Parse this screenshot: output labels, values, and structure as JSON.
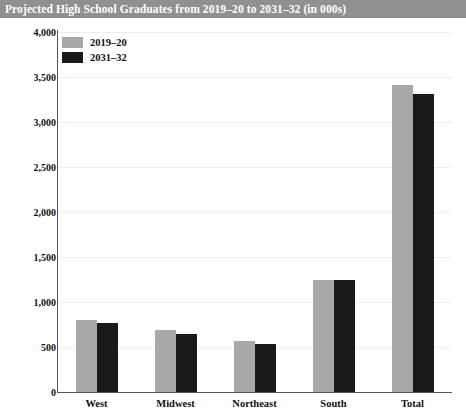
{
  "title": "Projected High School Graduates from 2019–20 to 2031–32 (in 000s)",
  "colors": {
    "title_bar_bg": "#909090",
    "title_text": "#ffffff",
    "series_a": "#a8a8a8",
    "series_b": "#1a1a1a",
    "gridline": "#eeeeee",
    "axis": "#555555",
    "background": "#ffffff"
  },
  "legend": {
    "position": "top-left",
    "entries": [
      {
        "label": "2019–20",
        "color": "#a8a8a8"
      },
      {
        "label": "2031–32",
        "color": "#1a1a1a"
      }
    ]
  },
  "chart_data": {
    "type": "bar",
    "title": "Projected High School Graduates from 2019–20 to 2031–32 (in 000s)",
    "xlabel": "",
    "ylabel": "",
    "categories": [
      "West",
      "Midwest",
      "Northeast",
      "South",
      "Total"
    ],
    "series": [
      {
        "name": "2019–20",
        "color": "#a8a8a8",
        "values": [
          800,
          690,
          570,
          1245,
          3410
        ]
      },
      {
        "name": "2031–32",
        "color": "#1a1a1a",
        "values": [
          765,
          645,
          535,
          1250,
          3310
        ]
      }
    ],
    "ylim": [
      0,
      4000
    ],
    "ytick_values": [
      0,
      500,
      1000,
      1500,
      2000,
      2500,
      3000,
      3500,
      4000
    ],
    "ytick_labels": [
      "0",
      "500",
      "1,000",
      "1,500",
      "2,000",
      "2,500",
      "3,000",
      "3,500",
      "4,000"
    ],
    "grid": true,
    "legend_position": "top-left"
  }
}
